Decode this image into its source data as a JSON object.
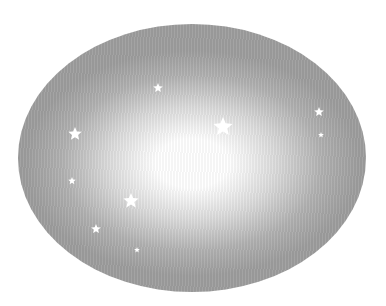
{
  "scene": {
    "background": "#ffffff",
    "ellipse": {
      "cx": 192,
      "cy": 158,
      "rx": 174,
      "ry": 134,
      "center_color": "#ffffff",
      "edge_color": "#9e9e9e"
    },
    "stars": [
      {
        "x": 158,
        "y": 88,
        "r": 5
      },
      {
        "x": 223,
        "y": 127,
        "r": 10
      },
      {
        "x": 319,
        "y": 112,
        "r": 5
      },
      {
        "x": 321,
        "y": 135,
        "r": 3
      },
      {
        "x": 75,
        "y": 134,
        "r": 7
      },
      {
        "x": 72,
        "y": 181,
        "r": 4
      },
      {
        "x": 131,
        "y": 201,
        "r": 8
      },
      {
        "x": 96,
        "y": 229,
        "r": 5
      },
      {
        "x": 137,
        "y": 250,
        "r": 3
      }
    ],
    "star_color": "#ffffff",
    "icon": "star-icon"
  }
}
